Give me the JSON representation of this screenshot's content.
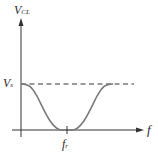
{
  "diagram": {
    "y_axis_label": {
      "main": "V",
      "sub": "CL"
    },
    "x_axis_label": "f",
    "level_label": {
      "main": "V",
      "sub": "s"
    },
    "minimum_label": {
      "main": "f",
      "sub": "r"
    },
    "colors": {
      "axis": "#333333",
      "curve": "#7a7a7a",
      "dashed": "#7a7a7a"
    }
  }
}
